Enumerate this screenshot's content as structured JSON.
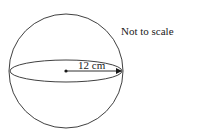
{
  "diagram": {
    "shape": "sphere",
    "radius_label": "12 cm",
    "note": "Not to scale",
    "colors": {
      "stroke": "#2a2a2a",
      "background": "#ffffff"
    }
  }
}
